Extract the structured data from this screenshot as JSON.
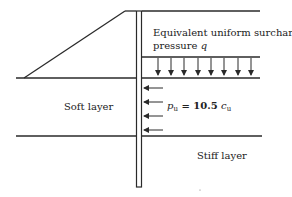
{
  "diagram": {
    "type": "geotechnical-pile-section",
    "labels": {
      "surcharge_line1": "Equivalent uniform surcharge",
      "surcharge_line2_prefix": "pressure ",
      "surcharge_symbol": "q",
      "soft_layer": "Soft layer",
      "stiff_layer": "Stiff layer",
      "pressure_p": "p",
      "pressure_p_sub": "u",
      "pressure_eq": " = 10.5 ",
      "pressure_c": "c",
      "pressure_c_sub": "u"
    },
    "colors": {
      "line": "#2a2a2a",
      "background": "#ffffff"
    },
    "surcharge_arrows_count": 8,
    "lateral_arrows_count": 4
  }
}
